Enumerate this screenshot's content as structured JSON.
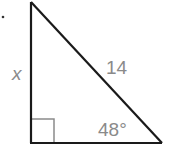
{
  "figure": {
    "type": "right-triangle",
    "side_label_left": "x",
    "hypotenuse_label": "14",
    "angle_label": "48°",
    "right_angle_marker": true,
    "colors": {
      "stroke": "#1a1a1a",
      "marker": "#8a8a8a",
      "label": "#8a8a8a"
    }
  }
}
